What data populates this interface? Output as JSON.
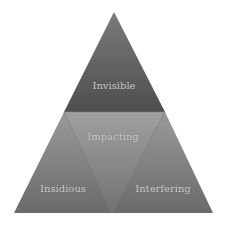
{
  "diagram": {
    "type": "triangle-pyramid",
    "segments": [
      {
        "id": "top",
        "label": "Invisible"
      },
      {
        "id": "center",
        "label": "Impacting"
      },
      {
        "id": "left",
        "label": "Insidious"
      },
      {
        "id": "right",
        "label": "Interfering"
      }
    ],
    "colors": {
      "top": "#5e5e5e",
      "center": "#8a8a8a",
      "left": "#7d7d7d",
      "right": "#7d7d7d",
      "edge": "#6a6a6a"
    }
  }
}
